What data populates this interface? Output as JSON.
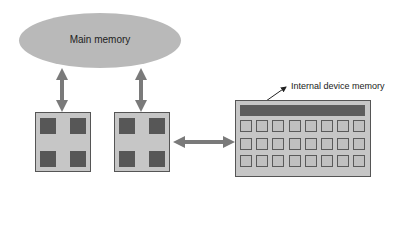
{
  "diagram": {
    "main_memory": {
      "label": "Main memory",
      "color": "#b9b9b9"
    },
    "processors": [
      {
        "name": "processor-1",
        "cores": 4
      },
      {
        "name": "processor-2",
        "cores": 4
      }
    ],
    "device": {
      "callout_label": "Internal device memory",
      "grid_rows": 3,
      "grid_cols": 8
    },
    "colors": {
      "chip_fill": "#c6c6c6",
      "core_fill": "#575757",
      "border": "#555555",
      "arrow": "#7a7a7a"
    }
  }
}
